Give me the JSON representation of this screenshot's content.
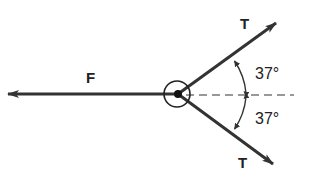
{
  "diagram": {
    "labels": {
      "force_left": "F",
      "tension_upper": "T",
      "tension_lower": "T",
      "angle_upper": "37°",
      "angle_lower": "37°"
    },
    "colors": {
      "line": "#333333",
      "background": "#ffffff"
    }
  }
}
